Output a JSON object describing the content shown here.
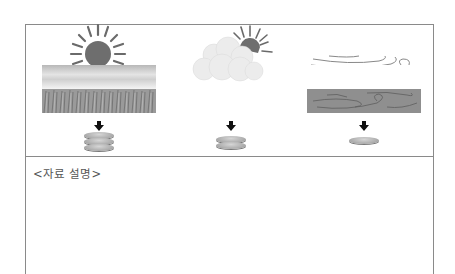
{
  "panels": [
    {
      "id": "sunny",
      "weather": "sunny",
      "icon": "sun-icon",
      "field": "dense-wheat-field",
      "grain_count": 3
    },
    {
      "id": "cloudy",
      "weather": "partly-cloudy",
      "icon": "sun-behind-cloud-icon",
      "field": "sparse-wheat-field",
      "grain_count": 2
    },
    {
      "id": "windy",
      "weather": "windy",
      "icon": "wind-icon",
      "field": "bare-soil-field",
      "grain_count": 1
    }
  ],
  "arrow_symbol": "down-arrow",
  "description": {
    "label": "<자료 설명>"
  },
  "colors": {
    "border": "#8a8a8a",
    "sun": "#6e6e6e",
    "grain": "#a8a8a8",
    "text": "#555555"
  }
}
